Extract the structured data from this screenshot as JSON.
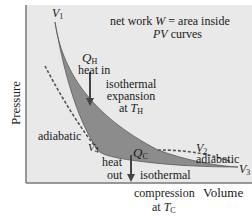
{
  "diagram": {
    "type": "PV diagram (Carnot cycle)",
    "axes": {
      "y_label": "Pressure",
      "x_label": "Volume"
    },
    "annotation_top": {
      "line1_prefix": "net work ",
      "line1_var": "W",
      "line1_suffix": " = area inside",
      "line2_var": "PV",
      "line2_suffix": " curves"
    },
    "points": {
      "v1": {
        "sym": "V",
        "sub": "1"
      },
      "v2": {
        "sym": "V",
        "sub": "2"
      },
      "v3": {
        "sym": "V",
        "sub": "3"
      },
      "v4": {
        "sym": "V",
        "sub": "4"
      }
    },
    "heat_in": {
      "q_sym": "Q",
      "q_sub": "H",
      "label": "heat in"
    },
    "isothermal_expansion": {
      "line1": "isothermal",
      "line2": "expansion",
      "line3_prefix": "at ",
      "t_sym": "T",
      "t_sub": "H"
    },
    "heat_out": {
      "q_sym": "Q",
      "q_sub": "C",
      "line1": "heat",
      "line2": "out"
    },
    "isothermal_compression": {
      "line1": "isothermal",
      "line2": "compression",
      "line3_prefix": "at ",
      "t_sym": "T",
      "t_sub": "C"
    },
    "adiabatic_left": "adiabatic",
    "adiabatic_right": "adiabatic",
    "colors": {
      "plot_bg": "#e9e9e9",
      "cycle_fill": "#8c8c8c",
      "curve": "#555555",
      "axis": "#777777"
    }
  }
}
